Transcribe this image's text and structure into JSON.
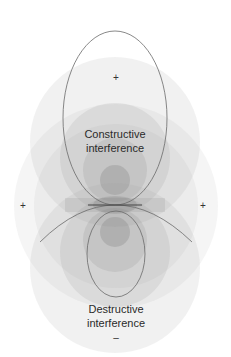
{
  "diagram": {
    "type": "wave-interference",
    "labels": {
      "constructive_line1": "Constructive",
      "constructive_line2": "interference",
      "destructive_line1": "Destructive",
      "destructive_line2": "interference"
    },
    "signs": {
      "top": "+",
      "left": "+",
      "right": "+",
      "bottom": "–"
    },
    "colors": {
      "ring_fill": "#808080",
      "outline": "#6a6a6a",
      "text": "#2a2a2a",
      "background": "#ffffff"
    }
  }
}
